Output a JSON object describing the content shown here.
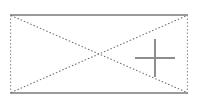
{
  "canvas": {
    "width": 202,
    "height": 102,
    "background_color": "#ffffff"
  },
  "placeholder": {
    "kind": "broken-image-placeholder",
    "alt_text": "",
    "box": {
      "left": 10,
      "top": 14,
      "width": 178,
      "height": 80
    },
    "interior_fill": "#ffffff",
    "borders": {
      "top": {
        "style": "solid",
        "color": "#9a9a9a",
        "width": 1.6
      },
      "bottom": {
        "style": "solid",
        "color": "#9a9a9a",
        "width": 1.6
      },
      "left": {
        "style": "dotted",
        "color": "#8f8f8f",
        "width": 1.1
      },
      "right": {
        "style": "dotted",
        "color": "#8f8f8f",
        "width": 1.1
      }
    },
    "diagonals": {
      "style": "dotted",
      "color": "#6d6d6d",
      "width": 1.05,
      "crossing_point": {
        "x": 99,
        "y": 54
      }
    },
    "marker": {
      "shape": "plus",
      "color": "#8d8d8d",
      "stroke_width": 1.7,
      "center": {
        "x": 155,
        "y": 58
      },
      "arm_length_x": 20,
      "arm_length_y": 19
    }
  }
}
